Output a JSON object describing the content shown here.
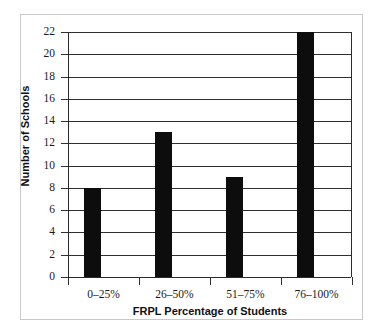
{
  "chart_data": {
    "type": "bar",
    "title": "",
    "subtitle": "",
    "xlabel": "FRPL Percentage of Students",
    "ylabel": "Number of Schools",
    "categories": [
      "0–25%",
      "26–50%",
      "51–75%",
      "76–100%"
    ],
    "values": [
      8,
      13,
      9,
      22
    ],
    "ylim": [
      0,
      22
    ],
    "ytick_labels": [
      "0",
      "2",
      "4",
      "6",
      "8",
      "10",
      "12",
      "14",
      "16",
      "18",
      "20",
      "22"
    ],
    "ytick_values": [
      0,
      2,
      4,
      6,
      8,
      10,
      12,
      14,
      16,
      18,
      20,
      22
    ],
    "grid": "horizontal",
    "legend": "none",
    "bar_color": "#0d0d0d",
    "grid_color": "#2f2f2f",
    "axis_color": "#2b2b2b",
    "frame_color": "#c9c9c9",
    "background": "#ffffff",
    "annotations": []
  }
}
